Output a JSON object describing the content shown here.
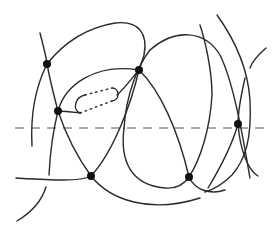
{
  "diagram": {
    "type": "curve-intersection-diagram",
    "colors": {
      "stroke": "#2a2a2a",
      "node": "#111111",
      "axis": "#555555",
      "background": "#ffffff"
    },
    "axis_line": {
      "style": "dashed",
      "y": 128,
      "x1": 15,
      "x2": 266
    },
    "nodes": [
      {
        "id": "n1",
        "x": 47,
        "y": 64
      },
      {
        "id": "n2",
        "x": 139,
        "y": 70
      },
      {
        "id": "n3",
        "x": 58,
        "y": 111
      },
      {
        "id": "n4",
        "x": 238,
        "y": 124
      },
      {
        "id": "n5",
        "x": 91,
        "y": 176
      },
      {
        "id": "n6",
        "x": 189,
        "y": 177
      }
    ],
    "handle": {
      "description": "dotted elongated loop between n3 and n2"
    }
  }
}
